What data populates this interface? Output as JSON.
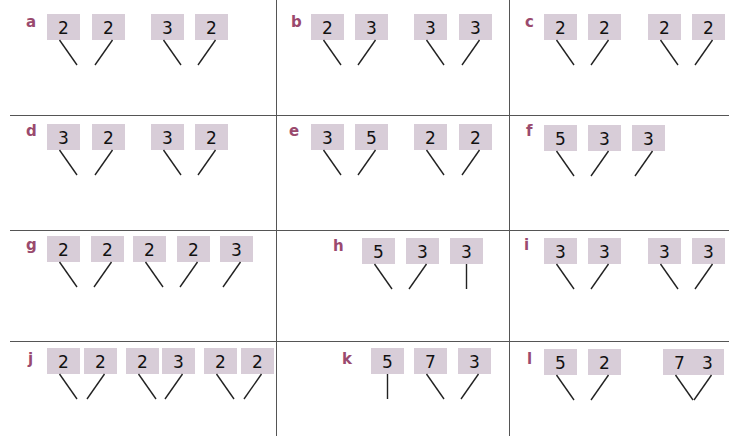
{
  "colors": {
    "label": "#9a4a6e",
    "box": "#d8cdd8",
    "grid": "#555555"
  },
  "problems": [
    {
      "label": "a",
      "x": 0,
      "y": 0,
      "lx": 26,
      "ly": 15,
      "boxes": [
        {
          "v": "2",
          "x": 47
        },
        {
          "v": "2",
          "x": 92
        },
        {
          "v": "3",
          "x": 151
        },
        {
          "v": "2",
          "x": 195
        }
      ],
      "by": 14,
      "lines": [
        [
          0,
          "r"
        ],
        [
          1,
          "l"
        ],
        [
          2,
          "r"
        ],
        [
          3,
          "l"
        ]
      ]
    },
    {
      "label": "b",
      "x": 0,
      "y": 0,
      "lx": 291,
      "ly": 15,
      "boxes": [
        {
          "v": "2",
          "x": 311
        },
        {
          "v": "3",
          "x": 355
        },
        {
          "v": "3",
          "x": 414
        },
        {
          "v": "3",
          "x": 459
        }
      ],
      "by": 14,
      "lines": [
        [
          0,
          "r"
        ],
        [
          1,
          "l"
        ],
        [
          2,
          "r"
        ],
        [
          3,
          "l"
        ]
      ]
    },
    {
      "label": "c",
      "x": 0,
      "y": 0,
      "lx": 525,
      "ly": 15,
      "boxes": [
        {
          "v": "2",
          "x": 544
        },
        {
          "v": "2",
          "x": 588
        },
        {
          "v": "2",
          "x": 648
        },
        {
          "v": "2",
          "x": 692
        }
      ],
      "by": 14,
      "lines": [
        [
          0,
          "r"
        ],
        [
          1,
          "l"
        ],
        [
          2,
          "r"
        ],
        [
          3,
          "l"
        ]
      ]
    },
    {
      "label": "d",
      "x": 0,
      "y": 0,
      "lx": 26,
      "ly": 124,
      "boxes": [
        {
          "v": "3",
          "x": 47
        },
        {
          "v": "2",
          "x": 92
        },
        {
          "v": "3",
          "x": 151
        },
        {
          "v": "2",
          "x": 195
        }
      ],
      "by": 124,
      "lines": [
        [
          0,
          "r"
        ],
        [
          1,
          "l"
        ],
        [
          2,
          "r"
        ],
        [
          3,
          "l"
        ]
      ]
    },
    {
      "label": "e",
      "x": 0,
      "y": 0,
      "lx": 289,
      "ly": 124,
      "boxes": [
        {
          "v": "3",
          "x": 311
        },
        {
          "v": "5",
          "x": 355
        },
        {
          "v": "2",
          "x": 414
        },
        {
          "v": "2",
          "x": 459
        }
      ],
      "by": 124,
      "lines": [
        [
          0,
          "r"
        ],
        [
          1,
          "l"
        ],
        [
          2,
          "r"
        ],
        [
          3,
          "l"
        ]
      ]
    },
    {
      "label": "f",
      "x": 0,
      "y": 0,
      "lx": 526,
      "ly": 124,
      "boxes": [
        {
          "v": "5",
          "x": 544
        },
        {
          "v": "3",
          "x": 588
        },
        {
          "v": "3",
          "x": 632
        }
      ],
      "by": 125,
      "lines": [
        [
          0,
          "r"
        ],
        [
          1,
          "l"
        ],
        [
          2,
          "l"
        ]
      ]
    },
    {
      "label": "g",
      "x": 0,
      "y": 0,
      "lx": 26,
      "ly": 238,
      "boxes": [
        {
          "v": "2",
          "x": 47
        },
        {
          "v": "2",
          "x": 91
        },
        {
          "v": "2",
          "x": 133
        },
        {
          "v": "2",
          "x": 177
        },
        {
          "v": "3",
          "x": 220
        }
      ],
      "by": 236,
      "lines": [
        [
          0,
          "r"
        ],
        [
          1,
          "l"
        ],
        [
          2,
          "r"
        ],
        [
          3,
          "l"
        ],
        [
          4,
          "l"
        ]
      ]
    },
    {
      "label": "h",
      "x": 0,
      "y": 0,
      "lx": 333,
      "ly": 239,
      "boxes": [
        {
          "v": "5",
          "x": 362
        },
        {
          "v": "3",
          "x": 406
        },
        {
          "v": "3",
          "x": 450
        }
      ],
      "by": 238,
      "lines": [
        [
          0,
          "r"
        ],
        [
          1,
          "l"
        ],
        [
          2,
          "s"
        ]
      ]
    },
    {
      "label": "i",
      "x": 0,
      "y": 0,
      "lx": 524,
      "ly": 238,
      "boxes": [
        {
          "v": "3",
          "x": 544
        },
        {
          "v": "3",
          "x": 588
        },
        {
          "v": "3",
          "x": 648
        },
        {
          "v": "3",
          "x": 692
        }
      ],
      "by": 238,
      "lines": [
        [
          0,
          "r"
        ],
        [
          1,
          "l"
        ],
        [
          2,
          "r"
        ],
        [
          3,
          "l"
        ]
      ]
    },
    {
      "label": "j",
      "x": 0,
      "y": 0,
      "lx": 28,
      "ly": 352,
      "boxes": [
        {
          "v": "2",
          "x": 47
        },
        {
          "v": "2",
          "x": 84
        },
        {
          "v": "2",
          "x": 126
        },
        {
          "v": "3",
          "x": 162
        },
        {
          "v": "2",
          "x": 204
        },
        {
          "v": "2",
          "x": 241
        }
      ],
      "by": 348,
      "lines": [
        [
          0,
          "r"
        ],
        [
          1,
          "l"
        ],
        [
          2,
          "r"
        ],
        [
          3,
          "l"
        ],
        [
          4,
          "r"
        ],
        [
          5,
          "l"
        ]
      ]
    },
    {
      "label": "k",
      "x": 0,
      "y": 0,
      "lx": 342,
      "ly": 352,
      "boxes": [
        {
          "v": "5",
          "x": 371
        },
        {
          "v": "7",
          "x": 414
        },
        {
          "v": "3",
          "x": 458
        }
      ],
      "by": 348,
      "lines": [
        [
          0,
          "s"
        ],
        [
          1,
          "r"
        ],
        [
          2,
          "l"
        ]
      ]
    },
    {
      "label": "l",
      "x": 0,
      "y": 0,
      "lx": 527,
      "ly": 352,
      "boxes": [
        {
          "v": "5",
          "x": 544
        },
        {
          "v": "2",
          "x": 588
        },
        {
          "v": "7",
          "x": 663
        },
        {
          "v": "3",
          "x": 691
        }
      ],
      "by": 349,
      "lines": [
        [
          0,
          "r"
        ],
        [
          1,
          "l"
        ],
        [
          2,
          "r"
        ],
        [
          3,
          "l"
        ]
      ]
    }
  ]
}
